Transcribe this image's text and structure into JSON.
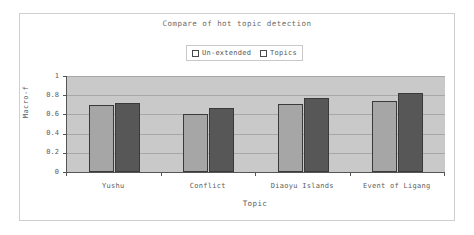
{
  "chart_data": {
    "type": "bar",
    "title": "Compare of hot topic detection",
    "xlabel": "Topic",
    "ylabel": "Macro-f",
    "categories": [
      "Yushu",
      "Conflict",
      "Diaoyu Islands",
      "Event of Ligang"
    ],
    "series": [
      {
        "name": "Un-extended",
        "values": [
          0.7,
          0.6,
          0.71,
          0.74
        ],
        "color": "#a6a6a6"
      },
      {
        "name": "Topics",
        "values": [
          0.72,
          0.67,
          0.77,
          0.82
        ],
        "color": "#575757"
      }
    ],
    "ylim": [
      0,
      1
    ],
    "yticks": [
      0,
      0.2,
      0.4,
      0.6,
      0.8,
      1
    ],
    "ytick_labels": [
      "0",
      "0.2",
      "0.4",
      "0.6",
      "0.8",
      "1"
    ],
    "grid": true,
    "legend_position": "top-center",
    "plot_background": "#c9c9c9",
    "axis_color": "#555555",
    "gridline_color": "#a8a8a8",
    "figure_background": "#ffffff",
    "frame_color": "#cfcfcf"
  }
}
